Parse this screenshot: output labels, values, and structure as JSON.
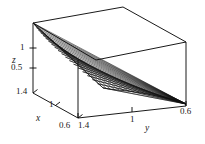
{
  "figure": {
    "kind": "3d-surface-plot",
    "background": "#ffffff",
    "line_color": "#000000",
    "mesh_color": "#111111"
  },
  "chart_data": {
    "type": "surface",
    "title": "",
    "xlabel": "x",
    "ylabel": "y",
    "zlabel": "z",
    "xlim": [
      0.6,
      1.4
    ],
    "ylim": [
      0.6,
      1.4
    ],
    "zlim": [
      0.35,
      1.45
    ],
    "xticks": [
      "1.4",
      "1",
      "0.6"
    ],
    "yticks": [
      "1.4",
      "1",
      "0.6"
    ],
    "zticks": [
      "1",
      "0.5"
    ],
    "grid": false,
    "legend": "none",
    "mesh_rows": 22,
    "mesh_cols": 22,
    "surface_note": "saddle-like mesh surface, high at x=1.4/y=1.4 corner, dipping to low at the x=0.6 front and converging to a point at the y=0.6 right corner",
    "x": [
      0.6,
      0.68,
      0.76,
      0.84,
      0.92,
      1.0,
      1.08,
      1.16,
      1.24,
      1.32,
      1.4
    ],
    "y": [
      0.6,
      0.68,
      0.76,
      0.84,
      0.92,
      1.0,
      1.08,
      1.16,
      1.24,
      1.32,
      1.4
    ],
    "z": [
      [
        0.42,
        0.47,
        0.52,
        0.58,
        0.64,
        0.7,
        0.77,
        0.84,
        0.91,
        0.98,
        1.06
      ],
      [
        0.45,
        0.51,
        0.57,
        0.63,
        0.7,
        0.77,
        0.84,
        0.91,
        0.99,
        1.06,
        1.14
      ],
      [
        0.49,
        0.55,
        0.62,
        0.69,
        0.76,
        0.83,
        0.91,
        0.98,
        1.06,
        1.14,
        1.21
      ],
      [
        0.53,
        0.6,
        0.67,
        0.74,
        0.82,
        0.89,
        0.97,
        1.05,
        1.13,
        1.2,
        1.27
      ],
      [
        0.58,
        0.65,
        0.72,
        0.8,
        0.88,
        0.95,
        1.03,
        1.11,
        1.18,
        1.26,
        1.32
      ],
      [
        0.63,
        0.7,
        0.78,
        0.86,
        0.94,
        1.01,
        1.09,
        1.17,
        1.24,
        1.31,
        1.37
      ],
      [
        0.68,
        0.76,
        0.84,
        0.92,
        1.0,
        1.07,
        1.15,
        1.22,
        1.29,
        1.35,
        1.4
      ],
      [
        0.74,
        0.82,
        0.9,
        0.98,
        1.06,
        1.13,
        1.2,
        1.27,
        1.33,
        1.38,
        1.42
      ],
      [
        0.8,
        0.88,
        0.96,
        1.04,
        1.11,
        1.18,
        1.25,
        1.31,
        1.36,
        1.4,
        1.43
      ],
      [
        0.86,
        0.94,
        1.02,
        1.09,
        1.16,
        1.23,
        1.29,
        1.34,
        1.38,
        1.42,
        1.44
      ],
      [
        0.92,
        1.0,
        1.07,
        1.14,
        1.21,
        1.27,
        1.32,
        1.37,
        1.4,
        1.43,
        1.45
      ]
    ]
  },
  "axes": {
    "z": {
      "name": "z",
      "tick_1": "1",
      "tick_05": "0.5"
    },
    "x": {
      "name": "x",
      "tick_hi": "1.4",
      "tick_mid": "1",
      "tick_lo": "0.6"
    },
    "y": {
      "name": "y",
      "tick_hi": "1.4",
      "tick_mid": "1",
      "tick_lo": "0.6"
    }
  }
}
